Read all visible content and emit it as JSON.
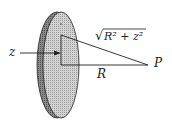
{
  "diagram": {
    "labels": {
      "z": "z",
      "R": "R",
      "P": "P",
      "hyp_radicand": "R² + z²",
      "hyp_root": "√"
    },
    "colors": {
      "disk_face": "#c8c8c8",
      "disk_edge": "#7a7a7a",
      "line": "#222222"
    }
  }
}
